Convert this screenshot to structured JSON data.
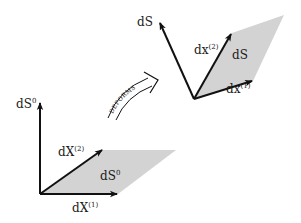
{
  "diagram": {
    "reference": {
      "normal_label": "dS",
      "normal_sup": "0",
      "vec1_label": "dX",
      "vec1_sup": "(1)",
      "vec2_label": "dX",
      "vec2_sup": "(2)",
      "area_label": "dS",
      "area_sup": "0"
    },
    "deformed": {
      "normal_label": "dS",
      "vec1_label": "dx",
      "vec1_sup": "(1)",
      "vec2_label": "dx",
      "vec2_sup": "(2)",
      "area_label": "dS"
    },
    "transition": {
      "label": "DEFORMS"
    },
    "colors": {
      "area_fill": "#d3d3d3",
      "stroke": "#111111",
      "background": "#ffffff"
    }
  }
}
